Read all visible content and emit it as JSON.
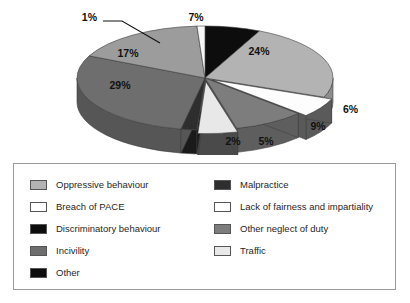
{
  "chart_data": {
    "type": "pie",
    "title": "",
    "subtitle": "",
    "xlabel": "",
    "ylabel": "",
    "legend_position": "bottom",
    "grid": false,
    "three_d": true,
    "value_unit": "%",
    "categories": [
      "Other",
      "Oppressive behaviour",
      "Lack of fairness and impartiality",
      "Traffic",
      "Other neglect of duty",
      "Malpractice",
      "Discriminatory behaviour",
      "Incivility",
      "Breach of PACE"
    ],
    "values": [
      7,
      24,
      6,
      5,
      9,
      2,
      1,
      29,
      17
    ],
    "labels": [
      "7%",
      "24%",
      "6%",
      "5%",
      "9%",
      "2%",
      "1%",
      "29%",
      "17%"
    ],
    "colors": [
      "#0d0d0d",
      "#b3b3b3",
      "#fdfdfd",
      "#e8e8e8",
      "#7d7d7d",
      "#2e2e2e",
      "#0d0d0d",
      "#6e6e6e",
      "#9c9c9c"
    ]
  },
  "slices": [
    {
      "name": "other",
      "label": "7%",
      "value": 7,
      "start": 0,
      "sweep": 25.2,
      "top": "#0d0d0d",
      "side": "#050505",
      "explode": 0,
      "lx": 196,
      "ly": 21,
      "anchor": "middle"
    },
    {
      "name": "oppressive-behaviour",
      "label": "24%",
      "value": 24,
      "start": 25.2,
      "sweep": 86.4,
      "top": "#b3b3b3",
      "side": "#8c8c8c",
      "explode": 0,
      "lx": 259,
      "ly": 55,
      "anchor": "middle"
    },
    {
      "name": "lack-of-fairness",
      "label": "6%",
      "value": 6,
      "start": 111.6,
      "sweep": 21.6,
      "top": "#fdfdfd",
      "side": "#5a5a5a",
      "explode": 9,
      "lx": 343,
      "ly": 113,
      "anchor": "start"
    },
    {
      "name": "traffic",
      "label": "5%",
      "value": 5,
      "start": 133.2,
      "sweep": 18.0,
      "top": "#e8e8e8",
      "side": "#4a4a4a",
      "explode": 9,
      "lx": 266,
      "ly": 145,
      "anchor": "middle"
    },
    {
      "name": "other-neglect-of-duty",
      "label": "9%",
      "value": 9,
      "start": 111.6,
      "sweep": 0,
      "top": "#7d7d7d",
      "side": "#5e5e5e",
      "explode": 0,
      "lx": 318,
      "ly": 130,
      "anchor": "middle"
    },
    {
      "name": "malpractice",
      "label": "2%",
      "value": 2,
      "start": 151.2,
      "sweep": 7.2,
      "top": "#2e2e2e",
      "side": "#1a1a1a",
      "explode": 0,
      "lx": 233,
      "ly": 145,
      "anchor": "middle"
    },
    {
      "name": "incivility",
      "label": "29%",
      "value": 29,
      "start": 158.4,
      "sweep": 104.4,
      "top": "#6e6e6e",
      "side": "#565656",
      "explode": 0,
      "lx": 120,
      "ly": 89,
      "anchor": "middle"
    },
    {
      "name": "breach-of-pace",
      "label": "17%",
      "value": 17,
      "start": 262.8,
      "sweep": 61.2,
      "top": "#9c9c9c",
      "side": "#7a7a7a",
      "explode": 0,
      "lx": 128,
      "ly": 57,
      "anchor": "middle"
    },
    {
      "name": "discriminatory-behaviour",
      "label": "1%",
      "value": 1,
      "start": 324.0,
      "sweep": 3.6,
      "top": "#f7f7f7",
      "side": "#9a9a9a",
      "explode": 0,
      "lx": 97,
      "ly": 21,
      "anchor": "end"
    }
  ],
  "callout": {
    "name": "one-percent-leader-line",
    "from_x": 103,
    "from_y": 21,
    "mid_x": 122,
    "mid_y": 21,
    "to_x": 160,
    "to_y": 43
  },
  "legend": {
    "left_column": [
      {
        "label": "Oppressive behaviour",
        "color": "#b3b3b3",
        "key": "oppressive-behaviour"
      },
      {
        "label": "Breach of PACE",
        "color": "#ffffff",
        "key": "breach-of-pace"
      },
      {
        "label": "Discriminatory behaviour",
        "color": "#0d0d0d",
        "key": "discriminatory-behaviour"
      },
      {
        "label": "Incivility",
        "color": "#6e6e6e",
        "key": "incivility"
      },
      {
        "label": "Other",
        "color": "#0d0d0d",
        "key": "other"
      }
    ],
    "right_column": [
      {
        "label": "Malpractice",
        "color": "#2e2e2e",
        "key": "malpractice"
      },
      {
        "label": "Lack of fairness and impartiality",
        "color": "#ffffff",
        "key": "lack-of-fairness"
      },
      {
        "label": "Other neglect of duty",
        "color": "#7d7d7d",
        "key": "other-neglect-of-duty"
      },
      {
        "label": "Traffic",
        "color": "#e8e8e8",
        "key": "traffic"
      }
    ]
  }
}
